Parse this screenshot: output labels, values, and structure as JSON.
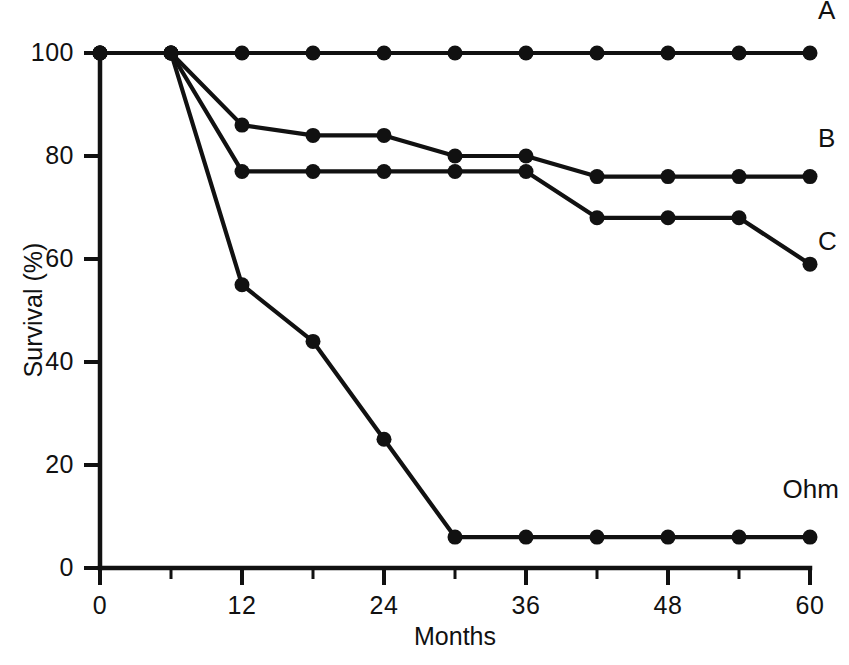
{
  "chart_data": {
    "type": "line",
    "title": "",
    "subtitle": "",
    "xlabel": "Months",
    "ylabel": "Survival (%)",
    "xlim": [
      0,
      60
    ],
    "ylim": [
      0,
      100
    ],
    "x_ticks": [
      0,
      12,
      24,
      36,
      48,
      60
    ],
    "x_tick_labels": [
      "0",
      "12",
      "24",
      "36",
      "48",
      "60"
    ],
    "x_minor_ticks": [
      6,
      18,
      30,
      42,
      54
    ],
    "y_ticks": [
      0,
      20,
      40,
      60,
      80,
      100
    ],
    "y_tick_labels": [
      "0",
      "20",
      "40",
      "60",
      "80",
      "100"
    ],
    "grid": false,
    "legend_position": "right-inline",
    "marker": "filled-circle",
    "line_color": "#111111",
    "x": [
      0,
      6,
      12,
      18,
      24,
      30,
      36,
      42,
      48,
      54,
      60
    ],
    "series": [
      {
        "name": "A",
        "label": "A",
        "values": [
          100,
          100,
          100,
          100,
          100,
          100,
          100,
          100,
          100,
          100,
          100
        ],
        "label_x": 60,
        "label_y": 108
      },
      {
        "name": "B",
        "label": "B",
        "values": [
          100,
          100,
          86,
          84,
          84,
          80,
          80,
          76,
          76,
          76,
          76
        ],
        "label_x": 60,
        "label_y": 83
      },
      {
        "name": "C",
        "label": "C",
        "values": [
          100,
          100,
          77,
          77,
          77,
          77,
          77,
          68,
          68,
          68,
          59
        ],
        "label_x": 60,
        "label_y": 63
      },
      {
        "name": "Ohm",
        "label": "Ohm",
        "values": [
          100,
          100,
          55,
          44,
          25,
          6,
          6,
          6,
          6,
          6,
          6
        ],
        "label_x": 57,
        "label_y": 15
      }
    ]
  },
  "axes": {
    "y_axis_title": "Survival (%)",
    "x_axis_title": "Months"
  }
}
